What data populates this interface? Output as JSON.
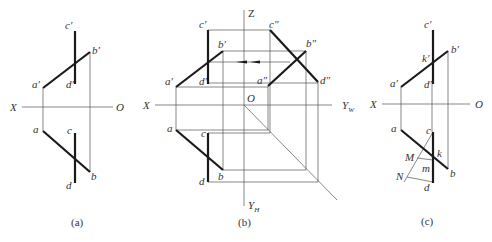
{
  "figures": [
    {
      "id": "a",
      "caption": "(a)",
      "axis": {
        "left_label": "X",
        "right_label": "O"
      },
      "points": {
        "a_prime": "a′",
        "b_prime": "b′",
        "c_prime": "c′",
        "d_prime": "d′",
        "a": "a",
        "b": "b",
        "c": "c",
        "d": "d"
      }
    },
    {
      "id": "b",
      "caption": "(b)",
      "axis": {
        "left_label": "X",
        "origin_label": "O",
        "z_label": "Z",
        "yw_label": "Y",
        "yw_sub": "W",
        "yh_label": "Y",
        "yh_sub": "H"
      },
      "points": {
        "a_prime": "a′",
        "b_prime": "b′",
        "c_prime": "c′",
        "d_prime": "d′",
        "a_dprime": "a″",
        "b_dprime": "b″",
        "c_dprime": "c″",
        "d_dprime": "d″",
        "a": "a",
        "b": "b",
        "c": "c",
        "d": "d"
      }
    },
    {
      "id": "c",
      "caption": "(c)",
      "axis": {
        "left_label": "X",
        "right_label": "O"
      },
      "points": {
        "a_prime": "a′",
        "b_prime": "b′",
        "c_prime": "c′",
        "d_prime": "d′",
        "k_prime": "k′",
        "a": "a",
        "b": "b",
        "c": "c",
        "d": "d",
        "k": "k",
        "M": "M",
        "N": "N",
        "m": "m"
      }
    }
  ]
}
